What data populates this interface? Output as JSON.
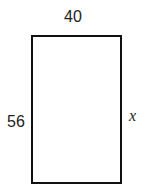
{
  "diagram": {
    "shape": "rectangle",
    "labels": {
      "top": "40",
      "left": "56",
      "right": "x"
    },
    "stroke_color": "#111111"
  }
}
